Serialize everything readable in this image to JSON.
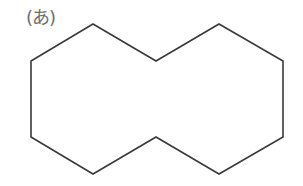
{
  "figure": {
    "label": "(あ)",
    "shape": {
      "type": "decagon-two-fused-hexagons",
      "points": [
        [
          31,
          61
        ],
        [
          93,
          24
        ],
        [
          156,
          61
        ],
        [
          219,
          24
        ],
        [
          283,
          61
        ],
        [
          283,
          137
        ],
        [
          219,
          174
        ],
        [
          156,
          137
        ],
        [
          93,
          174
        ],
        [
          31,
          137
        ]
      ],
      "stroke_color": "#3a3a3a",
      "fill_color": "#ffffff",
      "stroke_width": 1.6
    },
    "label_color": "#6e6e6e"
  }
}
